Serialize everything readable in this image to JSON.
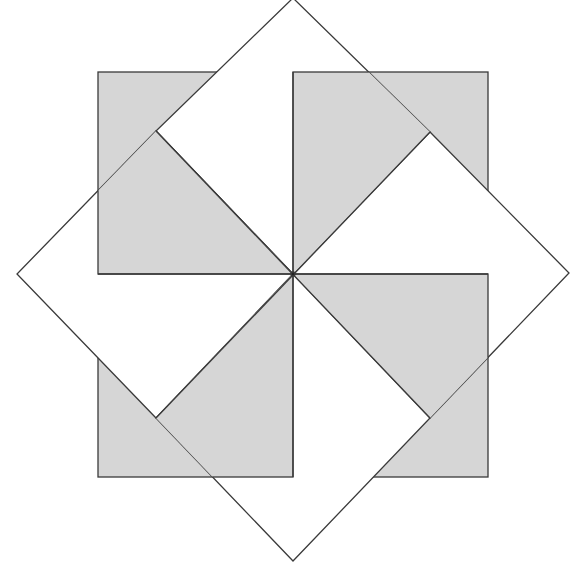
{
  "figure": {
    "center": [
      293,
      274
    ],
    "square_size": 195,
    "diamond_half_diagonal": 276,
    "colors": {
      "gray_fill": "#d6d6d6",
      "white_fill": "#ffffff",
      "stroke": "#3a3a3a",
      "background": "#ffffff"
    },
    "gray_squares": [
      {
        "id": "top-left",
        "x": 98,
        "y": 79,
        "w": 195,
        "h": 195
      },
      {
        "id": "top-right",
        "x": 293,
        "y": 79,
        "w": 195,
        "h": 195
      },
      {
        "id": "bottom-right",
        "x": 293,
        "y": 274,
        "w": 195,
        "h": 204
      },
      {
        "id": "bottom-left",
        "x": 98,
        "y": 274,
        "w": 195,
        "h": 204
      }
    ],
    "white_diamonds": [
      {
        "id": "top",
        "points": "293,274 156,131 293,-2 430,132"
      },
      {
        "id": "right",
        "points": "293,274 430,132 569,273 430,418"
      },
      {
        "id": "bottom",
        "points": "293,274 430,418 293,561 156,418"
      },
      {
        "id": "left",
        "points": "293,274 156,418 17,274 156,131"
      }
    ]
  }
}
